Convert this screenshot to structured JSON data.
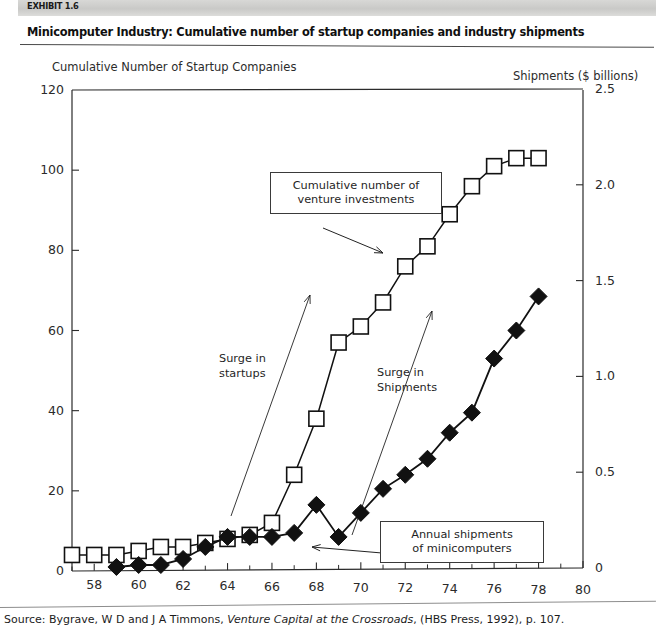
{
  "exhibit": {
    "tag": "EXHIBIT 1.6",
    "title": "Minicomputer Industry: Cumulative number of startup companies and industry shipments"
  },
  "source": {
    "prefix": "Source: Bygrave, W D and J A Timmons, ",
    "italic_title": "Venture Capital at the Crossroads",
    "suffix": ", (HBS Press, 1992), p. 107."
  },
  "annotations": {
    "venture_box": "Cumulative number of\nventure investments",
    "shipments_box": "Annual shipments\nof minicomputers",
    "surge_startups": "Surge in\nstartups",
    "surge_shipments": "Surge in\nShipments"
  },
  "chart_data": {
    "type": "line",
    "title": "Minicomputer Industry: Cumulative number of startup companies and industry shipments",
    "xlabel": "",
    "ylabel": "Cumulative Number of Startup Companies",
    "y2label": "Shipments ($ billions)",
    "xlim": [
      57,
      80
    ],
    "ylim": [
      0,
      120
    ],
    "y2lim": [
      0,
      2.5
    ],
    "xticks": [
      58,
      60,
      62,
      64,
      66,
      68,
      70,
      72,
      74,
      76,
      78,
      80
    ],
    "xtick_labels": [
      "58",
      "60",
      "62",
      "64",
      "66",
      "68",
      "70",
      "72",
      "74",
      "76",
      "78",
      "80"
    ],
    "xminorticks": [
      57,
      59,
      61,
      63,
      65,
      67,
      69,
      71,
      73,
      75,
      77,
      79
    ],
    "yticks": [
      0,
      20,
      40,
      60,
      80,
      100,
      120
    ],
    "ytick_labels": [
      "0",
      "20",
      "40",
      "60",
      "80",
      "100",
      "120"
    ],
    "y2ticks": [
      0,
      0.5,
      1.0,
      1.5,
      2.0,
      2.5
    ],
    "y2tick_labels": [
      "0",
      "0.5",
      "1.0",
      "1.5",
      "2.0",
      "2.5"
    ],
    "grid": false,
    "legend": "none",
    "series": [
      {
        "name": "Cumulative number of venture investments",
        "axis": "left",
        "marker": "open-square",
        "x": [
          57,
          58,
          59,
          60,
          61,
          62,
          63,
          64,
          65,
          66,
          67,
          68,
          69,
          70,
          71,
          72,
          73,
          74,
          75,
          76,
          77,
          78
        ],
        "values": [
          4,
          4,
          4,
          5,
          6,
          6,
          7,
          8,
          9,
          12,
          24,
          38,
          57,
          61,
          67,
          76,
          81,
          89,
          96,
          101,
          103,
          103
        ]
      },
      {
        "name": "Annual shipments of minicomputers",
        "axis": "right",
        "marker": "filled-diamond",
        "x": [
          59,
          60,
          61,
          62,
          63,
          64,
          65,
          66,
          67,
          68,
          69,
          70,
          71,
          72,
          73,
          74,
          75,
          76,
          77,
          78
        ],
        "values": [
          0.02,
          0.03,
          0.03,
          0.06,
          0.12,
          0.18,
          0.18,
          0.18,
          0.2,
          0.35,
          0.18,
          0.3,
          0.43,
          0.5,
          0.58,
          0.72,
          0.82,
          1.1,
          1.25,
          1.43
        ],
        "values_left_scale": [
          1,
          1.5,
          1.5,
          3,
          6,
          8.5,
          8.5,
          8.5,
          9.5,
          16.5,
          8.5,
          14.5,
          20.5,
          24,
          28,
          34.5,
          39.5,
          53,
          60,
          68.5
        ]
      }
    ]
  }
}
